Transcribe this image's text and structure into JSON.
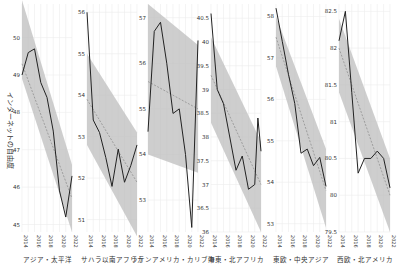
{
  "chart_data": {
    "type": "line",
    "title": "",
    "ylabel": "インターネットの自由度",
    "x": [
      2014,
      2015,
      2016,
      2017,
      2018,
      2019,
      2020,
      2021,
      2022
    ],
    "xticks": [
      "2014",
      "2016",
      "2018",
      "2020",
      "2022"
    ],
    "grid": true,
    "style": {
      "line_color": "#222222",
      "trend_color": "#888888",
      "band_color": "#bdbdbd",
      "grid_color": "#ececec"
    },
    "panels": [
      {
        "name": "アジア・太平洋",
        "ylim": [
          44.8,
          50.9
        ],
        "yticks": [
          "45",
          "46",
          "47",
          "48",
          "49",
          "50"
        ],
        "values": [
          49.0,
          49.6,
          49.7,
          48.8,
          48.4,
          47.5,
          45.9,
          45.2,
          46.3
        ],
        "trend": [
          49.3,
          45.7
        ],
        "band_upper": [
          51.0,
          46.6
        ],
        "band_lower": [
          48.9,
          44.8
        ]
      },
      {
        "name": "サハラ以南アフリカ",
        "ylim": [
          50.7,
          56.2
        ],
        "yticks": [
          "51",
          "52",
          "53",
          "54",
          "55",
          "56"
        ],
        "values": [
          56.0,
          53.4,
          53.1,
          52.5,
          51.8,
          52.7,
          51.9,
          52.3,
          52.8
        ],
        "trend": [
          53.9,
          51.9
        ],
        "band_upper": [
          55.0,
          53.1
        ],
        "band_lower": [
          52.8,
          50.6
        ]
      },
      {
        "name": "ラテンアメリカ・カリブ海",
        "ylim": [
          52.3,
          57.3
        ],
        "yticks": [
          "53",
          "54",
          "55",
          "56",
          "57"
        ],
        "values": [
          54.5,
          56.7,
          56.9,
          56.0,
          54.9,
          55.0,
          54.0,
          52.4,
          56.5
        ],
        "trend": [
          55.6,
          55.0
        ],
        "band_upper": [
          57.3,
          56.4
        ],
        "band_lower": [
          54.0,
          53.6
        ]
      },
      {
        "name": "中東・北アフリカ",
        "ylim": [
          36.0,
          40.8
        ],
        "yticks": [
          "36",
          "36.5",
          "37",
          "37.5",
          "38",
          "38.5",
          "39",
          "39.5",
          "40",
          "40.5"
        ],
        "values": [
          40.6,
          39.0,
          38.7,
          38.0,
          37.3,
          37.6,
          36.9,
          37.0,
          38.4,
          37.7
        ],
        "x_override": [
          2014,
          2015,
          2016,
          2017,
          2018,
          2019,
          2020,
          2021,
          2021.5,
          2022
        ],
        "trend": [
          39.3,
          37.0
        ],
        "band_upper": [
          40.1,
          37.9
        ],
        "band_lower": [
          38.3,
          36.0
        ]
      },
      {
        "name": "東欧・中央アジア",
        "ylim": [
          52.8,
          58.3
        ],
        "yticks": [
          "53",
          "54",
          "55",
          "56",
          "57",
          "58"
        ],
        "values": [
          58.2,
          57.4,
          56.6,
          55.9,
          54.7,
          54.8,
          54.4,
          54.6,
          53.9
        ],
        "trend": [
          57.5,
          53.8
        ],
        "band_upper": [
          58.0,
          54.8
        ],
        "band_lower": [
          56.8,
          52.9
        ]
      },
      {
        "name": "西欧・北アメリカ",
        "ylim": [
          79.5,
          82.6
        ],
        "yticks": [
          "79.5",
          "80",
          "80.5",
          "81",
          "81.5",
          "82",
          "82.5"
        ],
        "values": [
          82.1,
          82.5,
          81.4,
          80.3,
          80.5,
          80.5,
          80.6,
          80.5,
          80.1
        ],
        "trend": [
          82.0,
          80.0
        ],
        "band_upper": [
          82.4,
          80.5
        ],
        "band_lower": [
          81.4,
          79.5
        ]
      }
    ]
  }
}
